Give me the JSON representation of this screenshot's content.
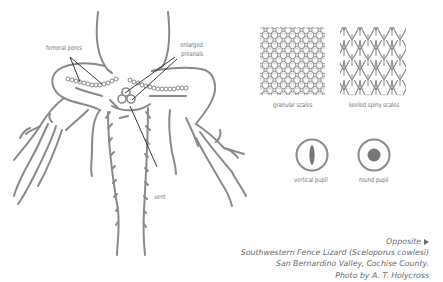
{
  "diagram": {
    "labels": {
      "femoral_pores": "femoral pores",
      "enlarged_preanals_line1": "enlarged",
      "enlarged_preanals_line2": "preanals",
      "vent": "vent"
    },
    "scale_types": [
      {
        "label": "granular scales",
        "icon": "granular-scales-icon"
      },
      {
        "label": "keeled spiny scales",
        "icon": "keeled-spiny-scales-icon"
      }
    ],
    "pupil_types": [
      {
        "label": "vertical pupil",
        "icon": "vertical-pupil-icon"
      },
      {
        "label": "round pupil",
        "icon": "round-pupil-icon"
      }
    ],
    "colors": {
      "line": "#8a8a8a",
      "text": "#7a7a7a",
      "leader": "#222222"
    }
  },
  "caption": {
    "opposite": "Opposite",
    "opposite_icon": "triangle-right-icon",
    "line1": "Southwestern Fence Lizard (Sceloporus cowlesi)",
    "line2": "San Bernardino Valley, Cochise County.",
    "line3": "Photo by A. T. Holycross"
  }
}
